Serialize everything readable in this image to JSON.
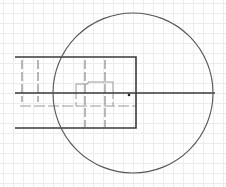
{
  "viewport": {
    "width": 226,
    "height": 187,
    "background": "#ffffff"
  },
  "grid": {
    "spacing": 10,
    "color": "#ececec",
    "origin_x": 3,
    "origin_y": 3
  },
  "colors": {
    "outline": "#3a3a3a",
    "hidden_line": "#9a9a9a",
    "circle": "#555555",
    "point": "#222222"
  },
  "shapes": {
    "circle": {
      "cx": 133,
      "cy": 93,
      "r": 80
    },
    "rectangle": {
      "left": 15,
      "top": 57,
      "right": 136,
      "bottom": 128
    },
    "centerline": {
      "x1": 15,
      "y1": 93,
      "x2": 215,
      "y2": 93
    },
    "hidden_verticals": [
      {
        "x": 22,
        "y1": 60,
        "y2": 102
      },
      {
        "x": 38,
        "y1": 60,
        "y2": 102
      },
      {
        "x": 85,
        "y1": 60,
        "y2": 127
      },
      {
        "x": 105,
        "y1": 60,
        "y2": 127
      }
    ],
    "inner_step_outline": "76,93 76,84 88,84 88,82 113,82 113,93",
    "inner_step_lower": "76,93 76,106 M 113,93 113,106",
    "hidden_horizontal": {
      "y": 106,
      "x1": 20,
      "x2": 136
    },
    "point": {
      "cx": 129,
      "cy": 95,
      "r": 1.3
    }
  }
}
